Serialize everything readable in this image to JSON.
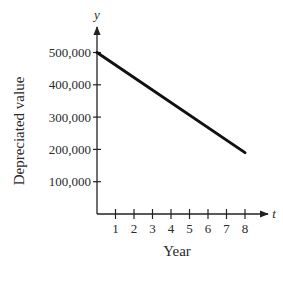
{
  "chart_data": {
    "type": "line",
    "title": "",
    "xlabel": "Year",
    "ylabel": "Depreciated value",
    "x_axis_variable": "t",
    "y_axis_variable": "y",
    "x_ticks": [
      1,
      2,
      3,
      4,
      5,
      6,
      7,
      8
    ],
    "y_ticks": [
      100000,
      200000,
      300000,
      400000,
      500000
    ],
    "y_tick_labels": [
      "100,000",
      "200,000",
      "300,000",
      "400,000",
      "500,000"
    ],
    "xlim": [
      0,
      9
    ],
    "ylim": [
      0,
      550000
    ],
    "grid": false,
    "legend": null,
    "series": [
      {
        "name": "Depreciated value",
        "x": [
          0,
          8
        ],
        "values": [
          500000,
          190000
        ]
      }
    ]
  },
  "colors": {
    "line": "#111111",
    "axis": "#222222",
    "background": "#ffffff"
  }
}
